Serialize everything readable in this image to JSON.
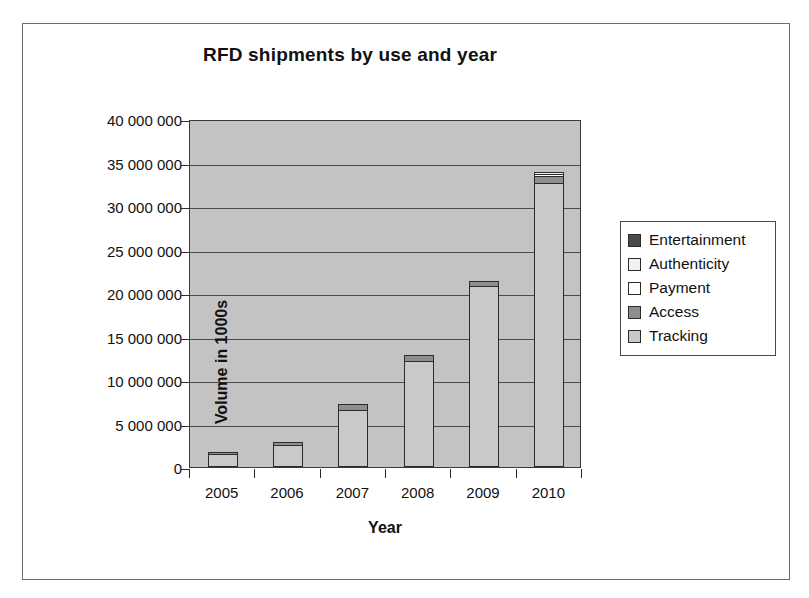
{
  "figure": {
    "frame_border_color": "#6b6b6b",
    "background": "#ffffff"
  },
  "chart_data": {
    "type": "bar",
    "subtype": "stacked-bar",
    "title": "RFD shipments by use and year",
    "xlabel": "Year",
    "ylabel": "Volume in 1000s",
    "categories": [
      "2005",
      "2006",
      "2007",
      "2008",
      "2009",
      "2010"
    ],
    "ylim": [
      0,
      40000000
    ],
    "ytick_step": 5000000,
    "ytick_labels": [
      "0",
      "5 000 000",
      "10 000 000",
      "15 000 000",
      "20 000 000",
      "25 000 000",
      "30 000 000",
      "35 000 000",
      "40 000 000"
    ],
    "ytick_values": [
      0,
      5000000,
      10000000,
      15000000,
      20000000,
      25000000,
      30000000,
      35000000,
      40000000
    ],
    "grid": true,
    "grid_axis": "y",
    "legend_position": "right",
    "plot_background": "#c3c3c3",
    "series": [
      {
        "name": "Tracking",
        "color": "#c9c9c9",
        "values": [
          1500000,
          2500000,
          6600000,
          12200000,
          20800000,
          32600000
        ]
      },
      {
        "name": "Access",
        "color": "#8e8e8e",
        "values": [
          200000,
          400000,
          600000,
          700000,
          600000,
          900000
        ]
      },
      {
        "name": "Payment",
        "color": "#ffffff",
        "values": [
          0,
          0,
          0,
          0,
          0,
          100000
        ]
      },
      {
        "name": "Authenticity",
        "color": "#f2f2f2",
        "values": [
          0,
          0,
          0,
          0,
          0,
          100000
        ]
      },
      {
        "name": "Entertainment",
        "color": "#4a4a4a",
        "values": [
          0,
          0,
          0,
          0,
          0,
          0
        ]
      }
    ],
    "totals": [
      1700000,
      2900000,
      7200000,
      12900000,
      21400000,
      33700000
    ]
  },
  "legend": {
    "items": [
      {
        "label": "Entertainment",
        "color": "#4a4a4a"
      },
      {
        "label": "Authenticity",
        "color": "#f2f2f2"
      },
      {
        "label": "Payment",
        "color": "#ffffff"
      },
      {
        "label": "Access",
        "color": "#8e8e8e"
      },
      {
        "label": "Tracking",
        "color": "#c9c9c9"
      }
    ]
  }
}
